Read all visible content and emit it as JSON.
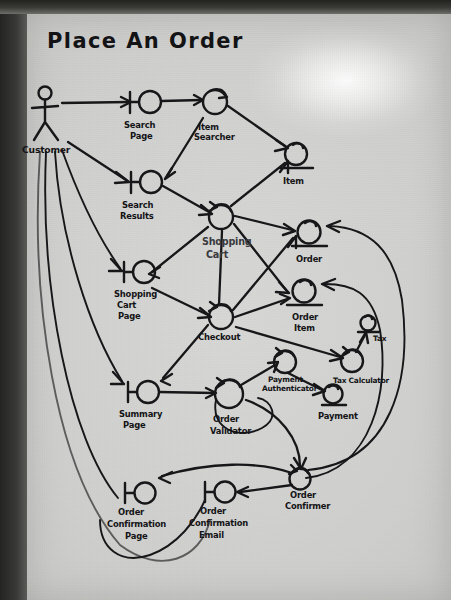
{
  "diagram": {
    "title": "Place An Order",
    "kind": "UML robustness diagram (hand-drawn on paper)",
    "actor": {
      "name": "Customer",
      "icon": "stick-figure-actor-icon"
    },
    "boundaries": [
      {
        "id": "search-page",
        "label_lines": [
          "Search",
          "Page"
        ]
      },
      {
        "id": "search-results",
        "label_lines": [
          "Search",
          "Results"
        ]
      },
      {
        "id": "shopping-cart-page",
        "label_lines": [
          "Shopping",
          "Cart",
          "Page"
        ]
      },
      {
        "id": "summary-page",
        "label_lines": [
          "Summary",
          "Page"
        ]
      },
      {
        "id": "order-confirmation-page",
        "label_lines": [
          "Order",
          "Confirmation",
          "Page"
        ]
      },
      {
        "id": "order-confirmation-email",
        "label_lines": [
          "Order",
          "Confirmation",
          "Email"
        ]
      }
    ],
    "controls": [
      {
        "id": "item-searcher",
        "label_lines": [
          "Item",
          "Searcher"
        ]
      },
      {
        "id": "shopping-cart",
        "label_lines": [
          "Shopping",
          "Cart"
        ]
      },
      {
        "id": "checkout",
        "label_lines": [
          "Checkout"
        ]
      },
      {
        "id": "order-validator",
        "label_lines": [
          "Order",
          "Validator"
        ]
      },
      {
        "id": "payment-authenticator",
        "label_lines": [
          "Payment",
          "Authenticator"
        ]
      },
      {
        "id": "tax-calculator",
        "label_lines": [
          "Tax Calculator"
        ]
      },
      {
        "id": "order-confirmer",
        "label_lines": [
          "Order",
          "Confirmer"
        ]
      }
    ],
    "entities": [
      {
        "id": "item",
        "label_lines": [
          "Item"
        ]
      },
      {
        "id": "order",
        "label_lines": [
          "Order"
        ]
      },
      {
        "id": "order-item",
        "label_lines": [
          "Order",
          "Item"
        ]
      },
      {
        "id": "tax",
        "label_lines": [
          "Tax"
        ]
      },
      {
        "id": "payment",
        "label_lines": [
          "Payment"
        ]
      }
    ],
    "connections": [
      {
        "from": "customer",
        "to": "search-page"
      },
      {
        "from": "customer",
        "to": "search-results"
      },
      {
        "from": "customer",
        "to": "shopping-cart-page"
      },
      {
        "from": "customer",
        "to": "summary-page"
      },
      {
        "from": "customer",
        "to": "order-confirmation-page"
      },
      {
        "from": "search-page",
        "to": "item-searcher"
      },
      {
        "from": "item-searcher",
        "to": "search-results"
      },
      {
        "from": "item-searcher",
        "to": "item"
      },
      {
        "from": "search-results",
        "to": "shopping-cart"
      },
      {
        "from": "shopping-cart",
        "to": "item"
      },
      {
        "from": "shopping-cart",
        "to": "shopping-cart-page"
      },
      {
        "from": "shopping-cart",
        "to": "order"
      },
      {
        "from": "shopping-cart",
        "to": "order-item"
      },
      {
        "from": "shopping-cart-page",
        "to": "checkout"
      },
      {
        "from": "checkout",
        "to": "shopping-cart"
      },
      {
        "from": "checkout",
        "to": "order"
      },
      {
        "from": "checkout",
        "to": "order-item"
      },
      {
        "from": "checkout",
        "to": "summary-page"
      },
      {
        "from": "checkout",
        "to": "tax-calculator"
      },
      {
        "from": "summary-page",
        "to": "order-validator"
      },
      {
        "from": "order-validator",
        "to": "payment-authenticator"
      },
      {
        "from": "payment-authenticator",
        "to": "payment"
      },
      {
        "from": "tax-calculator",
        "to": "tax"
      },
      {
        "from": "order-validator",
        "to": "order-confirmer"
      },
      {
        "from": "order-confirmer",
        "to": "order-confirmation-page"
      },
      {
        "from": "order-confirmer",
        "to": "order-confirmation-email"
      },
      {
        "from": "order-confirmer",
        "to": "order"
      },
      {
        "from": "order-confirmer",
        "to": "order-item"
      }
    ],
    "colors": {
      "ink": "#17171a",
      "paper": "#cfcfcd",
      "board": "#2e2e2c",
      "faint_ink": "#3a3a3e"
    }
  }
}
